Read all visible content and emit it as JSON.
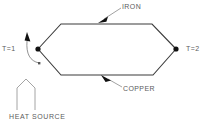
{
  "diagram": {
    "background_color": "#ffffff",
    "line_color": "#3b3b3b",
    "text_color": "#5c5c5c",
    "labels": {
      "junction_left": "T=1",
      "junction_right": "T=2",
      "upper_conductor": "IRON",
      "lower_conductor": "COPPER",
      "heat_source": "HEAT SOURCE"
    },
    "icons": {
      "junction_left": "filled-dot-icon",
      "junction_right": "filled-dot-icon",
      "heat_source": "upward-chevron-icon",
      "iron_leader": "arrow-icon",
      "copper_leader": "arrow-icon",
      "t1_leader": "curved-arrow-icon"
    }
  }
}
